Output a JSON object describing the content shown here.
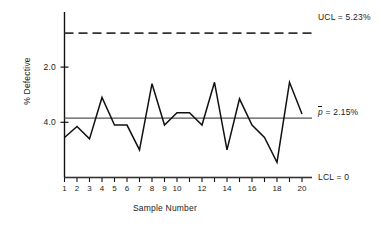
{
  "chart_data": {
    "type": "line",
    "title": "",
    "xlabel": "Sample Number",
    "ylabel": "% Defective",
    "xlim": [
      1,
      20
    ],
    "ylim": [
      0,
      6.0
    ],
    "yticks": [
      "2.0",
      "4.0"
    ],
    "ytick_values": [
      2.0,
      4.0
    ],
    "grid": false,
    "legend": "none",
    "categories": [
      1,
      2,
      3,
      4,
      5,
      6,
      7,
      8,
      9,
      10,
      11,
      12,
      13,
      14,
      15,
      16,
      17,
      18,
      19,
      20
    ],
    "xtick_labels": [
      "1",
      "2",
      "3",
      "4",
      "5",
      "6",
      "7",
      "8",
      "9",
      "10",
      "",
      "12",
      "",
      "14",
      "",
      "16",
      "",
      "18",
      "",
      "20"
    ],
    "series": [
      {
        "name": "% Defective",
        "values": [
          1.45,
          1.85,
          1.4,
          2.9,
          1.9,
          1.9,
          1.0,
          3.4,
          1.9,
          2.35,
          2.35,
          1.9,
          3.45,
          1.0,
          2.85,
          1.9,
          1.45,
          0.55,
          3.45,
          2.3
        ]
      }
    ],
    "reference_lines": [
      {
        "name": "UCL",
        "label": "UCL = 5.23%",
        "value": 5.23,
        "style": "dashed"
      },
      {
        "name": "p-bar",
        "label_prefix": "p",
        "label_suffix": " = 2.15%",
        "value": 2.15,
        "style": "solid"
      },
      {
        "name": "LCL",
        "label": "LCL = 0",
        "value": 0,
        "style": "solid"
      }
    ],
    "colors": {
      "line": "#111111",
      "axis": "#111111",
      "center_line": "#555555",
      "ucl_line": "#333333",
      "background": "#ffffff"
    }
  },
  "axis": {
    "y_label": "% Defective",
    "x_label": "Sample Number",
    "y_ticks": [
      {
        "label": "4.0",
        "value": 4.0
      },
      {
        "label": "2.0",
        "value": 2.0
      }
    ],
    "x_ticks": [
      {
        "label": "1"
      },
      {
        "label": "2"
      },
      {
        "label": "3"
      },
      {
        "label": "4"
      },
      {
        "label": "5"
      },
      {
        "label": "6"
      },
      {
        "label": "7"
      },
      {
        "label": "8"
      },
      {
        "label": "9"
      },
      {
        "label": "10"
      },
      {
        "label": ""
      },
      {
        "label": "12"
      },
      {
        "label": ""
      },
      {
        "label": "14"
      },
      {
        "label": ""
      },
      {
        "label": "16"
      },
      {
        "label": ""
      },
      {
        "label": "18"
      },
      {
        "label": ""
      },
      {
        "label": "20"
      }
    ]
  },
  "annotations": {
    "ucl": "UCL = 5.23%",
    "pbar_symbol": "p",
    "pbar_rest": " = 2.15%",
    "lcl": "LCL = 0"
  }
}
